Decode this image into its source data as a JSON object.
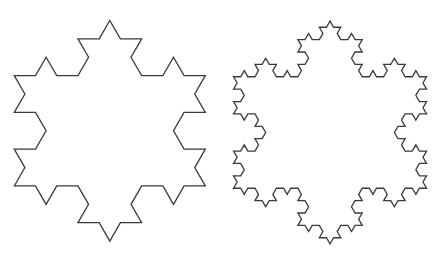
{
  "figure": {
    "width": 440,
    "height": 259,
    "background": "#ffffff",
    "stroke_color": "#3a3a3a",
    "stroke_width": 1.3,
    "snowflakes": [
      {
        "name": "koch-snowflake-iteration-2",
        "iteration": 2,
        "bbox": {
          "x_min": 15.3,
          "x_max": 204.3,
          "y_min": 19.3,
          "y_max": 242.3
        }
      },
      {
        "name": "koch-snowflake-iteration-3",
        "iteration": 3,
        "bbox": {
          "x_min": 235.3,
          "x_max": 424.8,
          "y_min": 19.0,
          "y_max": 246.0
        }
      }
    ]
  }
}
